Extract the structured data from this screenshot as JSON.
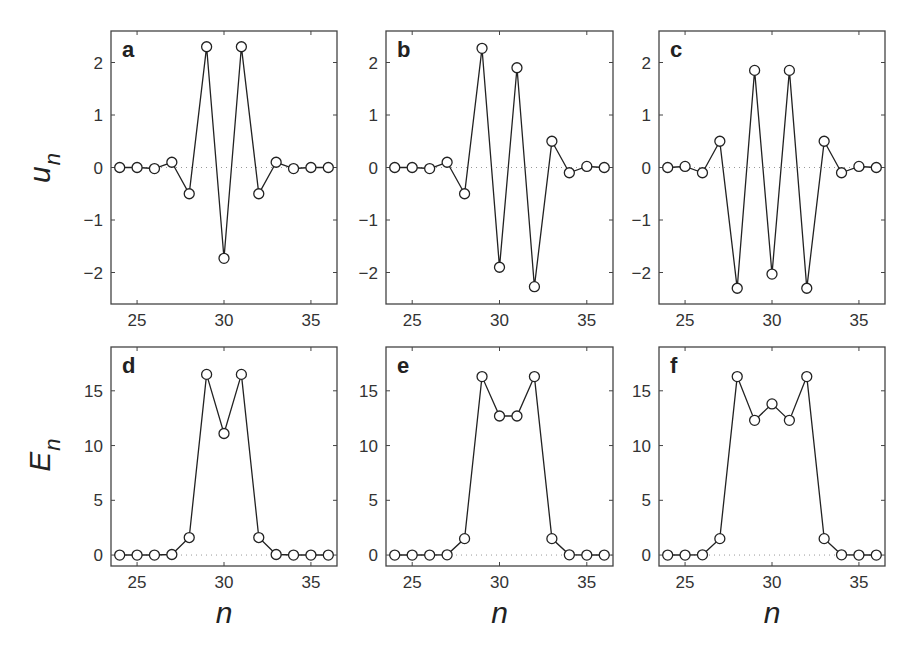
{
  "figure": {
    "row_labels": [
      {
        "main": "u",
        "sub": "n"
      },
      {
        "main": "E",
        "sub": "n"
      }
    ],
    "xlabel": "n"
  },
  "chart_data": [
    {
      "panel": "a",
      "type": "line",
      "marker": "open-circle",
      "x": [
        24,
        25,
        26,
        27,
        28,
        29,
        30,
        31,
        32,
        33,
        34,
        35,
        36
      ],
      "values": [
        0,
        0,
        -0.02,
        0.1,
        -0.5,
        2.3,
        -1.73,
        2.3,
        -0.5,
        0.1,
        -0.02,
        0,
        0
      ],
      "xlim": [
        23.5,
        36.5
      ],
      "ylim": [
        -2.6,
        2.6
      ],
      "xticks": [
        25,
        30,
        35
      ],
      "yticks": [
        -2,
        -1,
        0,
        1,
        2
      ],
      "ylabel": "u_n",
      "xlabel": "",
      "zero_line": "dotted",
      "grid": false
    },
    {
      "panel": "b",
      "type": "line",
      "marker": "open-circle",
      "x": [
        24,
        25,
        26,
        27,
        28,
        29,
        30,
        31,
        32,
        33,
        34,
        35,
        36
      ],
      "values": [
        0,
        0,
        -0.02,
        0.1,
        -0.5,
        2.27,
        -1.9,
        1.9,
        -2.27,
        0.5,
        -0.1,
        0.02,
        0
      ],
      "xlim": [
        23.5,
        36.5
      ],
      "ylim": [
        -2.6,
        2.6
      ],
      "xticks": [
        25,
        30,
        35
      ],
      "yticks": [
        -2,
        -1,
        0,
        1,
        2
      ],
      "ylabel": "",
      "xlabel": "",
      "zero_line": "dotted",
      "grid": false
    },
    {
      "panel": "c",
      "type": "line",
      "marker": "open-circle",
      "x": [
        24,
        25,
        26,
        27,
        28,
        29,
        30,
        31,
        32,
        33,
        34,
        35,
        36
      ],
      "values": [
        0,
        0.02,
        -0.1,
        0.5,
        -2.3,
        1.85,
        -2.03,
        1.85,
        -2.3,
        0.5,
        -0.1,
        0.02,
        0
      ],
      "xlim": [
        23.5,
        36.5
      ],
      "ylim": [
        -2.6,
        2.6
      ],
      "xticks": [
        25,
        30,
        35
      ],
      "yticks": [
        -2,
        -1,
        0,
        1,
        2
      ],
      "ylabel": "",
      "xlabel": "",
      "zero_line": "dotted",
      "grid": false
    },
    {
      "panel": "d",
      "type": "line",
      "marker": "open-circle",
      "x": [
        24,
        25,
        26,
        27,
        28,
        29,
        30,
        31,
        32,
        33,
        34,
        35,
        36
      ],
      "values": [
        0,
        0,
        0,
        0.05,
        1.6,
        16.5,
        11.1,
        16.5,
        1.6,
        0.05,
        0,
        0,
        0
      ],
      "xlim": [
        23.5,
        36.5
      ],
      "ylim": [
        -1,
        19
      ],
      "xticks": [
        25,
        30,
        35
      ],
      "yticks": [
        0,
        5,
        10,
        15
      ],
      "ylabel": "E_n",
      "xlabel": "n",
      "zero_line": "dotted",
      "grid": false
    },
    {
      "panel": "e",
      "type": "line",
      "marker": "open-circle",
      "x": [
        24,
        25,
        26,
        27,
        28,
        29,
        30,
        31,
        32,
        33,
        34,
        35,
        36
      ],
      "values": [
        0,
        0,
        0,
        0.02,
        1.5,
        16.3,
        12.7,
        12.7,
        16.3,
        1.5,
        0.02,
        0,
        0
      ],
      "xlim": [
        23.5,
        36.5
      ],
      "ylim": [
        -1,
        19
      ],
      "xticks": [
        25,
        30,
        35
      ],
      "yticks": [
        0,
        5,
        10,
        15
      ],
      "ylabel": "",
      "xlabel": "n",
      "zero_line": "dotted",
      "grid": false
    },
    {
      "panel": "f",
      "type": "line",
      "marker": "open-circle",
      "x": [
        24,
        25,
        26,
        27,
        28,
        29,
        30,
        31,
        32,
        33,
        34,
        35,
        36
      ],
      "values": [
        0,
        0,
        0.02,
        1.5,
        16.3,
        12.3,
        13.8,
        12.3,
        16.3,
        1.5,
        0.02,
        0,
        0
      ],
      "xlim": [
        23.5,
        36.5
      ],
      "ylim": [
        -1,
        19
      ],
      "xticks": [
        25,
        30,
        35
      ],
      "yticks": [
        0,
        5,
        10,
        15
      ],
      "ylabel": "",
      "xlabel": "n",
      "zero_line": "dotted",
      "grid": false
    }
  ]
}
